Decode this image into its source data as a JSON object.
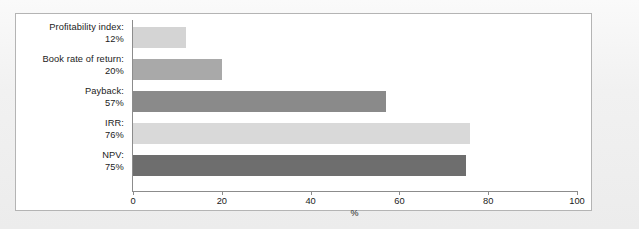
{
  "chart_data": {
    "type": "bar",
    "orientation": "horizontal",
    "title": "",
    "xlabel": "%",
    "ylabel": "",
    "xlim": [
      0,
      100
    ],
    "xticks": [
      0,
      20,
      40,
      60,
      80,
      100
    ],
    "grid": false,
    "legend": null,
    "categories": [
      "Profitability index:",
      "Book rate of return:",
      "Payback:",
      "IRR:",
      "NPV:"
    ],
    "value_labels": [
      "12%",
      "20%",
      "57%",
      "76%",
      "75%"
    ],
    "values": [
      12,
      20,
      57,
      76,
      75
    ],
    "bar_colors": [
      "#d4d4d4",
      "#a9a9a9",
      "#8a8a8a",
      "#d9d9d9",
      "#6e6e6e"
    ]
  },
  "figure": {
    "panel_background": "#ffffff",
    "panel_border": "#b4b4b4",
    "axis_color": "#8c8c8c",
    "text_color": "#1b1b1b"
  }
}
